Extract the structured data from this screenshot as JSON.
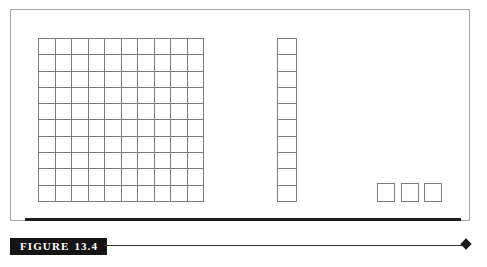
{
  "figure": {
    "caption_label": "FIGURE",
    "caption_number": "13.4",
    "caption_full": "FIGURE 13.4"
  },
  "manipulatives": {
    "hundreds_flat": {
      "name": "hundreds-flat",
      "rows": 10,
      "columns": 10,
      "unit_count": 100,
      "place_value": "hundreds"
    },
    "tens_rod": {
      "name": "tens-rod",
      "rows": 10,
      "columns": 1,
      "unit_count": 10,
      "place_value": "tens"
    },
    "ones_cubes": {
      "name": "ones-cubes",
      "count": 3,
      "place_value": "ones"
    },
    "represented_value": "113"
  },
  "colors": {
    "background": "#ffffff",
    "grid_line": "#7d7d7d",
    "frame_border": "#a8a8a8",
    "rule": "#1d1d1d",
    "caption_band_background": "#141414",
    "caption_band_text": "#ffffff",
    "diamond": "#1a1a1a"
  },
  "artifact_text": "scanned page edge"
}
